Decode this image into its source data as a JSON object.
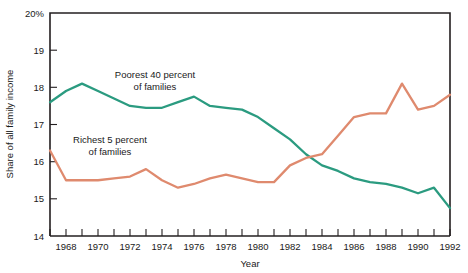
{
  "chart_data": {
    "type": "line",
    "title": "",
    "xlabel": "Year",
    "ylabel": "Share of all family income",
    "xlim": [
      1967,
      1992
    ],
    "ylim": [
      14,
      20
    ],
    "grid": false,
    "legend_position": "inline-annotations",
    "y_ticks": [
      20,
      19,
      18,
      17,
      16,
      15,
      14
    ],
    "y_tick_labels": [
      "20%",
      "19",
      "18",
      "17",
      "16",
      "15",
      "14"
    ],
    "x_ticks": [
      1967,
      1968,
      1969,
      1970,
      1971,
      1972,
      1973,
      1974,
      1975,
      1976,
      1977,
      1978,
      1979,
      1980,
      1981,
      1982,
      1983,
      1984,
      1985,
      1986,
      1987,
      1988,
      1989,
      1990,
      1991,
      1992
    ],
    "x_tick_labels_shown": [
      "1968",
      "1970",
      "1972",
      "1974",
      "1976",
      "1978",
      "1980",
      "1982",
      "1984",
      "1986",
      "1988",
      "1990",
      "1992"
    ],
    "x": [
      1967,
      1968,
      1969,
      1970,
      1971,
      1972,
      1973,
      1974,
      1975,
      1976,
      1977,
      1978,
      1979,
      1980,
      1981,
      1982,
      1983,
      1984,
      1985,
      1986,
      1987,
      1988,
      1989,
      1990,
      1991,
      1992
    ],
    "series": [
      {
        "name": "Poorest 40 percent of families",
        "color": "#2b9b80",
        "values": [
          17.6,
          17.9,
          18.1,
          17.9,
          17.7,
          17.5,
          17.45,
          17.45,
          17.6,
          17.75,
          17.5,
          17.45,
          17.4,
          17.2,
          16.9,
          16.6,
          16.2,
          15.9,
          15.75,
          15.55,
          15.45,
          15.4,
          15.3,
          15.15,
          15.3,
          14.75
        ]
      },
      {
        "name": "Richest 5 percent of families",
        "color": "#df8a6e",
        "values": [
          16.3,
          15.5,
          15.5,
          15.5,
          15.55,
          15.6,
          15.8,
          15.5,
          15.3,
          15.4,
          15.55,
          15.65,
          15.55,
          15.45,
          15.45,
          15.9,
          16.1,
          16.2,
          16.7,
          17.2,
          17.3,
          17.3,
          18.1,
          17.4,
          17.5,
          17.8
        ]
      }
    ],
    "annotations": [
      {
        "text_line1": "Poorest 40 percent",
        "text_line2": "of families",
        "x": 1977.5,
        "y": 18.95
      },
      {
        "text_line1": "Richest 5 percent",
        "text_line2": "of families",
        "x": 1972.5,
        "y": 16.95
      }
    ]
  },
  "axis": {
    "y_label": "Share of all family income",
    "x_label": "Year",
    "y_tick_20": "20%",
    "y_tick_19": "19",
    "y_tick_18": "18",
    "y_tick_17": "17",
    "y_tick_16": "16",
    "y_tick_15": "15",
    "y_tick_14": "14"
  },
  "x_labels": {
    "t1968": "1968",
    "t1970": "1970",
    "t1972": "1972",
    "t1974": "1974",
    "t1976": "1976",
    "t1978": "1978",
    "t1980": "1980",
    "t1982": "1982",
    "t1984": "1984",
    "t1986": "1986",
    "t1988": "1988",
    "t1990": "1990",
    "t1992": "1992"
  },
  "annotations": {
    "poorest_line1": "Poorest 40 percent",
    "poorest_line2": "of families",
    "richest_line1": "Richest 5 percent",
    "richest_line2": "of families"
  },
  "colors": {
    "poorest": "#2b9b80",
    "richest": "#df8a6e",
    "axis": "#231f20",
    "background": "#ffffff"
  }
}
